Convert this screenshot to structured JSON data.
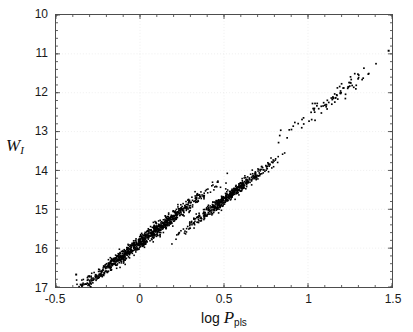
{
  "figure": {
    "background": "#ffffff",
    "frame_color": "#4d4d4d",
    "grid_color": "#e8e8e8",
    "marker_color": "#000000"
  },
  "axis": {
    "xlabel_prefix": "log ",
    "xlabel_symbol": "P",
    "xlabel_subscript": "pls",
    "ylabel_symbol": "W",
    "ylabel_subscript": "I",
    "xticks": [
      "-0.5",
      "0",
      "0.5",
      "1",
      "1.5"
    ],
    "yticks": [
      "10",
      "11",
      "12",
      "13",
      "14",
      "15",
      "16",
      "17"
    ]
  },
  "chart_data": {
    "type": "scatter",
    "title": "",
    "xlabel": "log P_pls",
    "ylabel": "W_I",
    "xlim": [
      -0.5,
      1.5
    ],
    "ylim": [
      10,
      17
    ],
    "y_inverted": true,
    "grid": true,
    "legend": null,
    "xticks": [
      -0.5,
      0,
      0.5,
      1,
      1.5
    ],
    "yticks": [
      10,
      11,
      12,
      13,
      14,
      15,
      16,
      17
    ],
    "marker": "square",
    "marker_size_px": 1.6,
    "marker_color": "#000000",
    "series": [
      {
        "name": "sequence-1",
        "description": "Upper (brighter) ridge: fundamental-mode period-luminosity sequence, slope about -3.3 mag/dex",
        "n_points": 980,
        "fit": {
          "slope": -3.32,
          "intercept": 15.85
        },
        "scatter_sigma": 0.085,
        "x_range": [
          -0.4,
          0.84
        ],
        "x_density": "concentrated between 0.15 and 0.60, tapering below 0.05 and above 0.70"
      },
      {
        "name": "sequence-2",
        "description": "Lower (fainter) ridge: offset sequence, roughly 0.50 mag fainter, similar slope",
        "n_points": 520,
        "fit": {
          "slope": -3.32,
          "intercept": 16.42
        },
        "scatter_sigma": 0.075,
        "x_range": [
          0.12,
          0.92
        ],
        "x_density": "concentrated between 0.30 and 0.75"
      },
      {
        "name": "sequence-extension",
        "description": "Sparse bright extension of the main relation toward long periods",
        "n_points": 85,
        "fit": {
          "slope": -3.32,
          "intercept": 15.95
        },
        "scatter_sigma": 0.1,
        "x_range": [
          0.82,
          1.49
        ],
        "x_density": "sparse, roughly uniform"
      }
    ],
    "notable_points": [
      {
        "x": -0.38,
        "y": 16.68,
        "note": "isolated faintest point, lower-left"
      },
      {
        "x": 1.48,
        "y": 10.92,
        "note": "brightest point, upper-right near frame"
      }
    ]
  }
}
